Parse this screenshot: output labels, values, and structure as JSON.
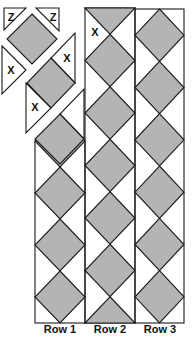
{
  "diagram": {
    "title": "",
    "colors": {
      "fill": "#b4b4b4",
      "stroke": "#1a1a1a",
      "background": "#ffffff"
    },
    "piece_labels": {
      "corner": "Z",
      "side": "X"
    },
    "rows": [
      {
        "label": "Row 1",
        "pattern": "diamonds-aligned",
        "diamonds": 4,
        "exploded_top": true
      },
      {
        "label": "Row 2",
        "pattern": "diamonds-offset",
        "diamonds": 5,
        "half_diamonds": 2
      },
      {
        "label": "Row 3",
        "pattern": "diamonds-aligned",
        "diamonds": 6
      }
    ],
    "exploded_pieces": [
      {
        "type": "corner-triangle",
        "label": "Z"
      },
      {
        "type": "corner-triangle",
        "label": "Z"
      },
      {
        "type": "side-triangle",
        "label": "X"
      },
      {
        "type": "side-triangle",
        "label": "X"
      },
      {
        "type": "side-triangle",
        "label": "X"
      },
      {
        "type": "side-triangle",
        "label": "X"
      }
    ]
  }
}
